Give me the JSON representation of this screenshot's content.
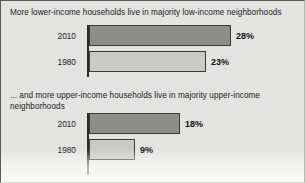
{
  "chart_data": {
    "type": "bar",
    "orientation": "horizontal",
    "grid": false,
    "legend": null,
    "xlabel": "",
    "ylabel": "",
    "xlim": [
      0,
      30
    ],
    "panels": [
      {
        "id": "lower-income",
        "title": "More lower-income households live in majority low-income neighborhoods",
        "categories": [
          "2010",
          "1980"
        ],
        "values": [
          28,
          23
        ],
        "value_labels": [
          "28%",
          "23%"
        ],
        "bar_styles": [
          "dark",
          "light"
        ]
      },
      {
        "id": "upper-income",
        "title": "... and more upper-income households live in majority upper-income neighborhoods",
        "categories": [
          "2010",
          "1980"
        ],
        "values": [
          18,
          9
        ],
        "value_labels": [
          "18%",
          "9%"
        ],
        "bar_styles": [
          "dark",
          "light"
        ]
      }
    ]
  },
  "colors": {
    "background": "#e3e3e1",
    "bar_dark": "#8d8d8b",
    "bar_light": "#cacac8",
    "bar_outline": "#3a3a3a",
    "axis": "#2b2b2b",
    "text": "#1b1b1b"
  }
}
